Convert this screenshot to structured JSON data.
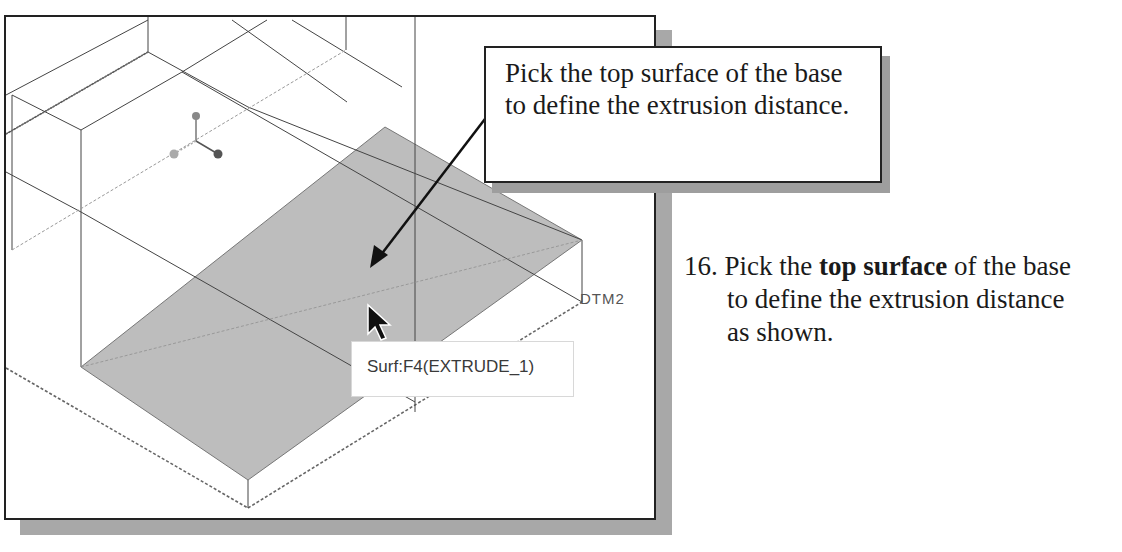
{
  "figure": {
    "callout_text": "Pick the top surface of the base to define the extrusion distance.",
    "tooltip": "Surf:F4(EXTRUDE_1)",
    "datum_label": "DTM2",
    "highlight_color": "#bdbdbd",
    "shadow_color": "#a8a8a8"
  },
  "instruction": {
    "number": "16.",
    "text_before": "Pick the",
    "bold_text": "top surface",
    "text_after_line1": "of the base",
    "line2": "to define the extrusion distance",
    "line3": "as shown."
  }
}
